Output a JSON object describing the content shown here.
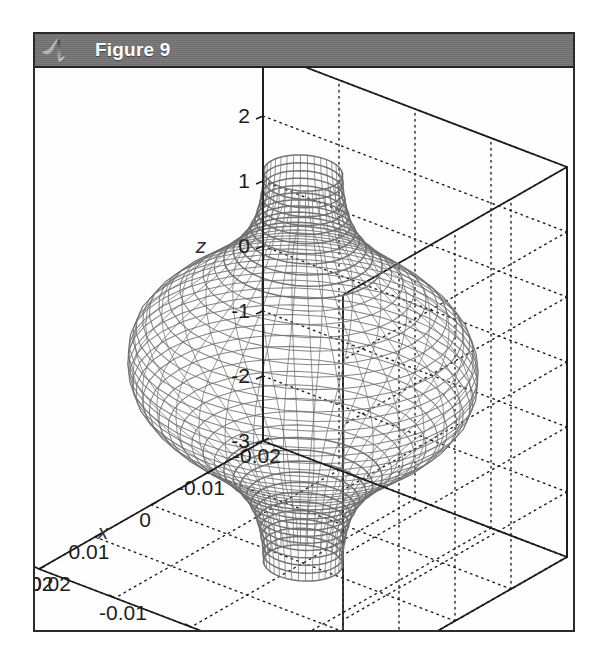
{
  "window": {
    "title": "Figure 9",
    "icon": "matlab-membrane-icon",
    "titlebar_color": "#757575",
    "title_text_color": "#ffffff",
    "background_color": "#fdfdfd",
    "border_color": "#2b2b2b"
  },
  "chart_data": {
    "type": "surface",
    "title": "",
    "xlabel": "x",
    "ylabel": "y",
    "zlabel": "z",
    "xticks": [
      "-0.02",
      "-0.01",
      "0",
      "0.01",
      "0.02"
    ],
    "xtick_values": [
      -0.02,
      -0.01,
      0,
      0.01,
      0.02
    ],
    "yticks": [
      "-0.02",
      "-0.01",
      "0",
      "0.01",
      "0.02"
    ],
    "ytick_values": [
      -0.02,
      -0.01,
      0,
      0.01,
      0.02
    ],
    "zticks": [
      "3",
      "2",
      "1",
      "0",
      "-1",
      "-2",
      "-3"
    ],
    "ztick_values": [
      3,
      2,
      1,
      0,
      -1,
      -2,
      -3
    ],
    "xlim": [
      -0.02,
      0.02
    ],
    "ylim": [
      -0.02,
      0.02
    ],
    "zlim": [
      -3,
      3
    ],
    "grid": true,
    "grid_style": "dotted",
    "legend": null,
    "mesh_color": "#6e6e6e",
    "axis_color": "#1d1d1d",
    "surface_profile": {
      "z": [
        -3.0,
        -2.75,
        -2.5,
        -2.25,
        -2.0,
        -1.75,
        -1.5,
        -1.25,
        -1.0,
        -0.75,
        -0.5,
        -0.25,
        0.0,
        0.25,
        0.5,
        0.75,
        1.0,
        1.25,
        1.5,
        1.75,
        2.0,
        2.25,
        2.5,
        2.75,
        3.0
      ],
      "radius": [
        0.0042,
        0.0043,
        0.0046,
        0.0051,
        0.006,
        0.0074,
        0.0094,
        0.0118,
        0.0143,
        0.0163,
        0.0177,
        0.0184,
        0.0186,
        0.0184,
        0.0177,
        0.0163,
        0.0143,
        0.0118,
        0.0094,
        0.0074,
        0.006,
        0.0051,
        0.0046,
        0.0043,
        0.0042
      ]
    },
    "view": {
      "azimuth": -37.5,
      "elevation": 18
    },
    "n_rings": 25,
    "n_meridians": 36
  }
}
